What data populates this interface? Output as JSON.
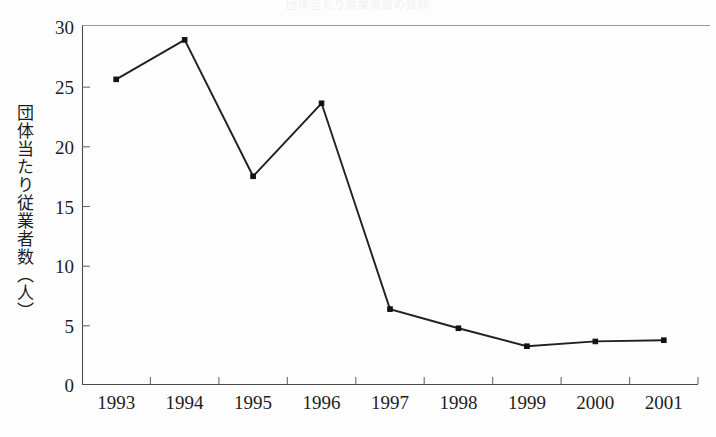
{
  "chart_data": {
    "type": "line",
    "title": "団体当たり従業者数の推移",
    "xlabel": "",
    "ylabel": "団体当たり従業者数（人）",
    "categories": [
      "1993",
      "1994",
      "1995",
      "1996",
      "1997",
      "1998",
      "1999",
      "2000",
      "2001"
    ],
    "values": [
      25.5,
      28.8,
      17.4,
      23.5,
      6.3,
      4.7,
      3.2,
      3.6,
      3.7
    ],
    "series": [
      {
        "name": "団体当たり従業者数（人）",
        "values": [
          25.5,
          28.8,
          17.4,
          23.5,
          6.3,
          4.7,
          3.2,
          3.6,
          3.7
        ]
      }
    ],
    "ylim": [
      0,
      30
    ],
    "yticks": [
      0,
      5,
      10,
      15,
      20,
      25,
      30
    ],
    "ytick_labels": [
      "0",
      "5",
      "10",
      "15",
      "20",
      "25",
      "30"
    ],
    "grid": false,
    "legend": false,
    "legend_position": "none",
    "marker": "square",
    "line_color": "#212121",
    "marker_color": "#121212",
    "background_color": "#ffffff"
  }
}
